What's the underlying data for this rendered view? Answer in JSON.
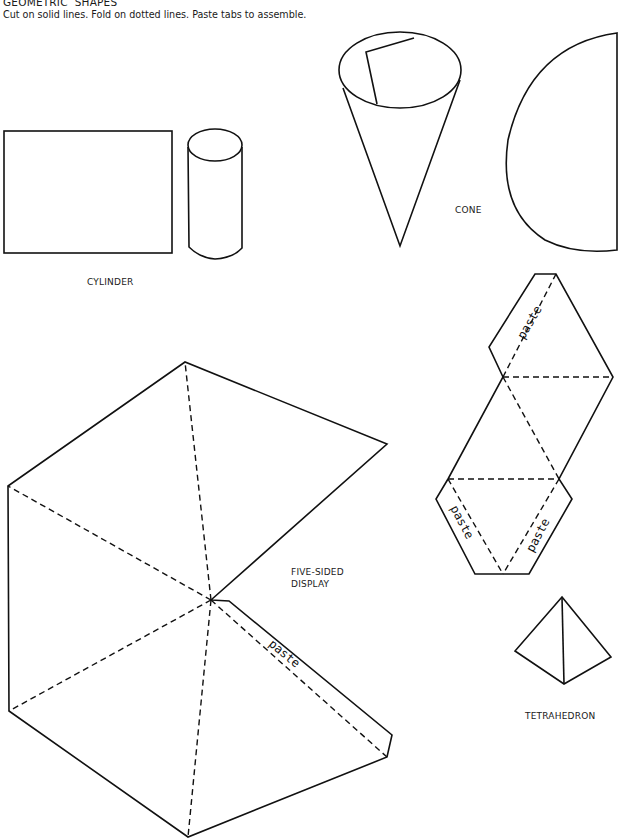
{
  "header": {
    "title": "GEOMETRIC  SHAPES",
    "instructions": "Cut on solid lines. Fold on dotted lines. Paste tabs to assemble."
  },
  "shapes": {
    "cylinder": {
      "label": "CYLINDER"
    },
    "cone": {
      "label": "CONE"
    },
    "five_sided_display": {
      "label_line1": "FIVE-SIDED",
      "label_line2": "DISPLAY",
      "tab_label": "paste"
    },
    "tetrahedron": {
      "label": "TETRAHEDRON",
      "tab_labels": [
        "paste",
        "paste",
        "paste"
      ]
    }
  },
  "colors": {
    "ink": "#111111",
    "paper": "#ffffff"
  }
}
